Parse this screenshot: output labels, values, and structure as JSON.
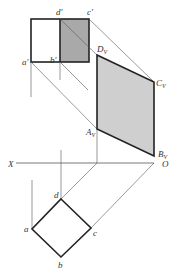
{
  "diagram": {
    "type": "orthographic-projection-auxiliary-view",
    "colors": {
      "shade_dark": "#a9a9a9",
      "shade_light": "#cfcfcf",
      "line": "#222222",
      "thin_line": "#555555"
    },
    "labels": {
      "a_prime": "a′",
      "b_prime": "b′",
      "c_prime": "c′",
      "d_prime": "d′",
      "Dv": "D",
      "Cv": "C",
      "Av": "A",
      "Bv": "B",
      "v_sub": "V",
      "X": "X",
      "O": "O",
      "a": "a",
      "b": "b",
      "c": "c",
      "d": "d"
    }
  }
}
